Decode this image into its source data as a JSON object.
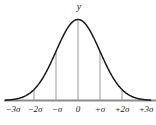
{
  "figure": {
    "name": "normal-distribution-curve",
    "background_color": "#ffffff",
    "width": 156,
    "height": 125,
    "curve_color": "#1a1a1a",
    "axis_color": "#8c8c8c",
    "dropline_color": "#8c8c8c",
    "y_axis_label": "y"
  },
  "chart_data": {
    "type": "line",
    "title": "",
    "subtitle": "",
    "xlabel": "",
    "ylabel": "y",
    "grid": false,
    "legend": null,
    "xlim": [
      -3.3,
      3.3
    ],
    "ylim": [
      0,
      1.05
    ],
    "x_tick_labels": [
      "−3σ",
      "−2σ",
      "−σ",
      "0",
      "+σ",
      "+2σ",
      "+3σ"
    ],
    "x_tick_values": [
      -3,
      -2,
      -1,
      0,
      1,
      2,
      3
    ],
    "y_tick_labels": [],
    "droplines_at": [
      -2,
      -1,
      0,
      1,
      2
    ],
    "x": [
      -3.3,
      -3,
      -2.75,
      -2.5,
      -2.25,
      -2,
      -1.75,
      -1.5,
      -1.25,
      -1,
      -0.75,
      -0.5,
      -0.25,
      0,
      0.25,
      0.5,
      0.75,
      1,
      1.25,
      1.5,
      1.75,
      2,
      2.25,
      2.5,
      2.75,
      3,
      3.3
    ],
    "values": [
      0.0043,
      0.0111,
      0.0228,
      0.0439,
      0.0796,
      0.1353,
      0.2163,
      0.3247,
      0.4578,
      0.6065,
      0.7548,
      0.8825,
      0.9692,
      1.0,
      0.9692,
      0.8825,
      0.7548,
      0.6065,
      0.4578,
      0.3247,
      0.2163,
      0.1353,
      0.0796,
      0.0439,
      0.0228,
      0.0111,
      0.0043
    ]
  },
  "axis_labels": [
    {
      "text": "−3σ",
      "x": 13
    },
    {
      "text": "−2σ",
      "x": 35
    },
    {
      "text": "−σ",
      "x": 57
    },
    {
      "text": "0",
      "x": 78
    },
    {
      "text": "+σ",
      "x": 100
    },
    {
      "text": "+2σ",
      "x": 122
    },
    {
      "text": "+3σ",
      "x": 146
    }
  ]
}
